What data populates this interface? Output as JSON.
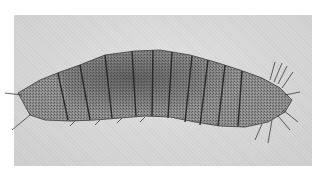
{
  "image": {
    "subject": "segmented insect larva",
    "style": "grayscale micrograph",
    "segment_count": 11,
    "colors": {
      "background": "#ffffff",
      "photo_background": "#d8d8d8",
      "body_fill": "#8a8a8a",
      "body_dark": "#4a4a4a",
      "segment_lines": "#2e2e2e",
      "setae": "#3a3a3a"
    }
  }
}
